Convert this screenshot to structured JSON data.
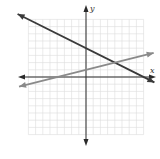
{
  "chart_data": {
    "type": "line",
    "title": "",
    "xlabel": "x",
    "ylabel": "y",
    "xlim": [
      -8,
      8
    ],
    "ylim": [
      -8,
      8
    ],
    "grid": true,
    "grid_step": 1,
    "series": [
      {
        "name": "line-dark",
        "equation": "y = -1/2 x + 4",
        "slope": -0.5,
        "intercept": 4,
        "color": "#3a3a3a",
        "points": [
          [
            -9.5,
            8.75
          ],
          [
            9.5,
            -0.75
          ]
        ]
      },
      {
        "name": "line-gray",
        "equation": "y = 1/4 x + 1",
        "slope": 0.25,
        "intercept": 1,
        "color": "#8a8a8a",
        "points": [
          [
            -9.3,
            -1.33
          ],
          [
            9.4,
            3.35
          ]
        ]
      }
    ],
    "intersection": [
      4,
      2
    ]
  },
  "labels": {
    "x": "x",
    "y": "y"
  },
  "colors": {
    "grid": "#dcdcdc",
    "axis": "#2a2a2a",
    "dark_line": "#3a3a3a",
    "gray_line": "#8a8a8a"
  }
}
